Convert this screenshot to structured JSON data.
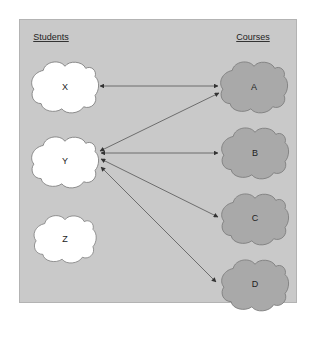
{
  "headings": {
    "students": "Students",
    "courses": "Courses"
  },
  "students": [
    {
      "id": "X",
      "label": "X"
    },
    {
      "id": "Y",
      "label": "Y"
    },
    {
      "id": "Z",
      "label": "Z"
    }
  ],
  "courses": [
    {
      "id": "A",
      "label": "A"
    },
    {
      "id": "B",
      "label": "B"
    },
    {
      "id": "C",
      "label": "C"
    },
    {
      "id": "D",
      "label": "D"
    }
  ],
  "edges": [
    {
      "from": "X",
      "to": "A",
      "direction": "both"
    },
    {
      "from": "Y",
      "to": "A",
      "direction": "both"
    },
    {
      "from": "Y",
      "to": "B",
      "direction": "both"
    },
    {
      "from": "Y",
      "to": "C",
      "direction": "both"
    },
    {
      "from": "Y",
      "to": "D",
      "direction": "both"
    }
  ],
  "colors": {
    "panel_background": "#c9c9c9",
    "student_fill": "#ffffff",
    "course_fill": "#a9a9a9",
    "outline": "#7a7a7a",
    "arrow": "#555555"
  }
}
